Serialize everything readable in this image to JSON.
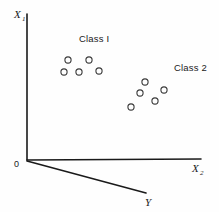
{
  "figure": {
    "caption_present": false,
    "background_color": "#fefefe",
    "ink_color": "#1a1a1a"
  },
  "axes": {
    "vertical": {
      "label": "X",
      "subscript": "1",
      "label_x": 14,
      "label_y": 18,
      "sub_x": 22,
      "sub_y": 21,
      "x1": 27,
      "y1": 14,
      "x2": 27,
      "y2": 160
    },
    "horizontal": {
      "label": "X",
      "subscript": "2",
      "label_x": 192,
      "label_y": 172,
      "sub_x": 200,
      "sub_y": 175,
      "x1": 27,
      "y1": 160,
      "x2": 201,
      "y2": 159
    },
    "depth": {
      "label": "Y",
      "label_x": 145,
      "label_y": 206,
      "x1": 27,
      "y1": 161,
      "x2": 146,
      "y2": 193
    },
    "origin": {
      "label": "0",
      "x": 14,
      "y": 167
    }
  },
  "chart_data": {
    "type": "scatter",
    "title": "",
    "xlabel": "X2",
    "ylabel": "X1",
    "zlabel": "Y",
    "grid": false,
    "legend_position": "inline-annotation",
    "marker": "open-circle",
    "marker_radius": 3.1,
    "series": [
      {
        "name": "Class I",
        "label_x": 79,
        "label_y": 42,
        "points": [
          {
            "x": 68,
            "y": 60
          },
          {
            "x": 89,
            "y": 60
          },
          {
            "x": 64,
            "y": 72
          },
          {
            "x": 79,
            "y": 72
          },
          {
            "x": 99,
            "y": 71
          }
        ]
      },
      {
        "name": "Class 2",
        "label_x": 174,
        "label_y": 71,
        "points": [
          {
            "x": 145,
            "y": 82
          },
          {
            "x": 140,
            "y": 93
          },
          {
            "x": 164,
            "y": 90
          },
          {
            "x": 155,
            "y": 101
          },
          {
            "x": 131,
            "y": 107
          }
        ]
      }
    ]
  }
}
